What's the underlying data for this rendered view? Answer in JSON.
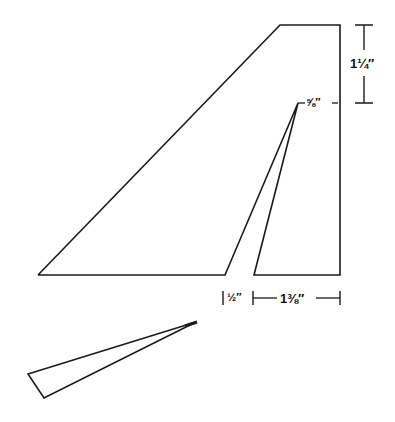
{
  "diagram": {
    "type": "template-drawing",
    "line_color": "#1a1a1a",
    "background": "#ffffff",
    "shapes": {
      "main_fin": [
        [
          280,
          25
        ],
        [
          340,
          25
        ],
        [
          340,
          275
        ],
        [
          254,
          275
        ],
        [
          298,
          103
        ],
        [
          225,
          275
        ],
        [
          38,
          275
        ]
      ],
      "small_piece": [
        [
          28,
          374
        ],
        [
          196,
          322
        ],
        [
          44,
          398
        ]
      ]
    },
    "dimensions": {
      "top_height": "1¼″",
      "notch_width": "⅝″",
      "gap_width": "½″",
      "right_base_width": "1⅜″"
    }
  }
}
